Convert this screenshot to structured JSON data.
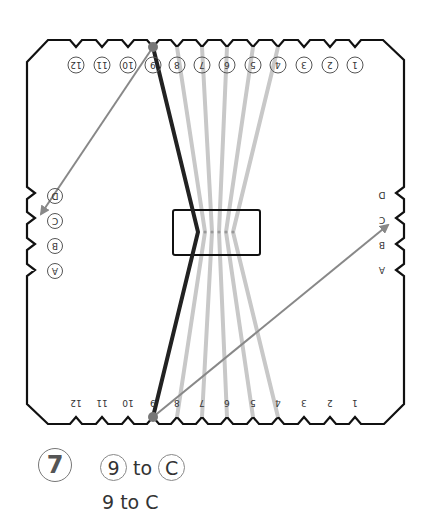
{
  "diagram": {
    "top_labels": [
      "1",
      "2",
      "3",
      "4",
      "5",
      "6",
      "7",
      "8",
      "9",
      "10",
      "11",
      "12"
    ],
    "bottom_labels": [
      "1",
      "2",
      "3",
      "4",
      "5",
      "6",
      "7",
      "8",
      "9",
      "10",
      "11",
      "12"
    ],
    "left_labels": [
      "D",
      "C",
      "B",
      "A"
    ],
    "right_labels": [
      "D",
      "C",
      "B",
      "A"
    ],
    "active_peg": "9",
    "target_slot": "C",
    "colors": {
      "outline": "#111111",
      "active_strand": "#222222",
      "inactive_strand": "#c8c8c8",
      "arrow": "#888888",
      "peg": "#777777"
    }
  },
  "step": {
    "number": "7",
    "from": "9",
    "connector": "to",
    "to": "C",
    "text": "9 to C"
  }
}
